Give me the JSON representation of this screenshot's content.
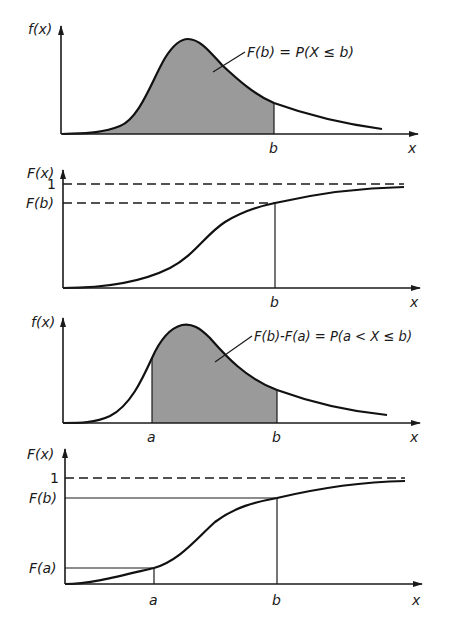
{
  "colors": {
    "ink": "#1a1a1a",
    "shade": "#9a9a9a",
    "background": "#ffffff"
  },
  "panels": [
    {
      "id": "pdf-cumulative",
      "y_label": "f(x)",
      "x_label": "x",
      "x_ticks": [
        "b"
      ],
      "annotation": "F(b) = P(X ≤ b)"
    },
    {
      "id": "cdf-single",
      "y_label": "F(x)",
      "x_label": "x",
      "x_ticks": [
        "b"
      ],
      "y_ticks": [
        "1",
        "F(b)"
      ]
    },
    {
      "id": "pdf-interval",
      "y_label": "f(x)",
      "x_label": "x",
      "x_ticks": [
        "a",
        "b"
      ],
      "annotation": "F(b)-F(a) = P(a < X ≤ b)"
    },
    {
      "id": "cdf-interval",
      "y_label": "F(x)",
      "x_label": "x",
      "x_ticks": [
        "a",
        "b"
      ],
      "y_ticks": [
        "1",
        "F(b)",
        "F(a)"
      ]
    }
  ]
}
